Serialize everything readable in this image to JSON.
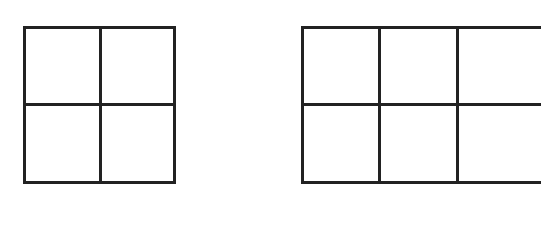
{
  "diagram": {
    "line_color": "#222222",
    "background": "#ffffff",
    "grids": [
      {
        "name": "2x2 grid",
        "rows": 2,
        "cols": 2,
        "x": 23,
        "y": 26,
        "width": 153,
        "height": 158
      },
      {
        "name": "2x3 grid (cut off at right edge)",
        "rows": 2,
        "cols": 3,
        "x": 301,
        "y": 26,
        "width": 232,
        "height": 158
      }
    ]
  }
}
